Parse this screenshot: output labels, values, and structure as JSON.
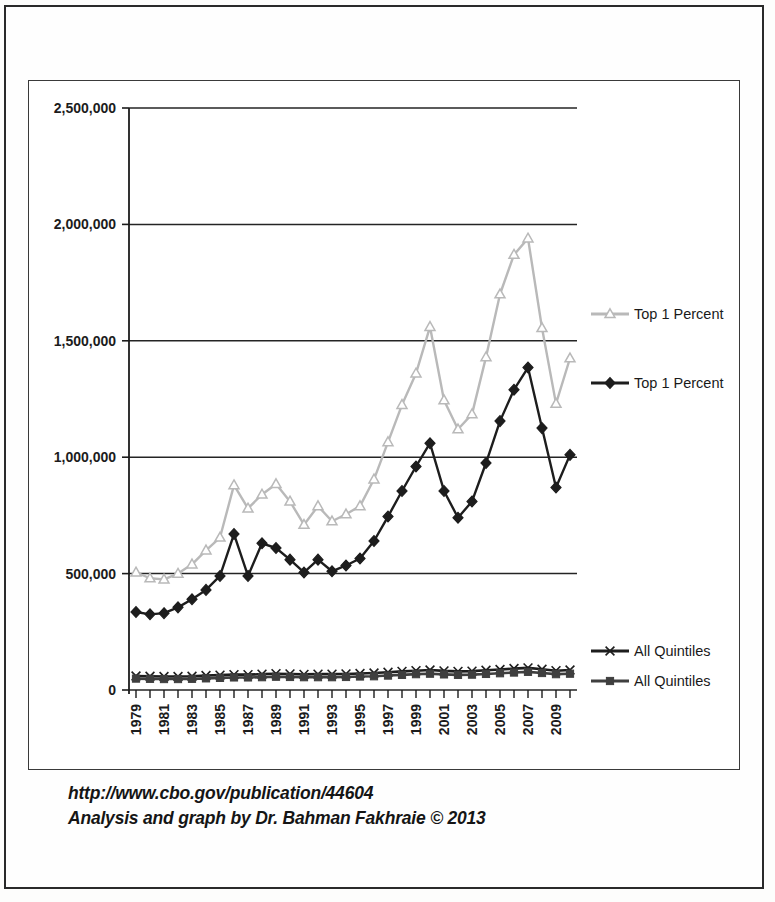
{
  "caption": {
    "line1": "http://www.cbo.gov/publication/44604",
    "line2": "Analysis and graph by Dr. Bahman Fakhraie © 2013"
  },
  "legend": [
    {
      "label": "Top 1 Percent",
      "marker": "triangle-marker",
      "color": "#b9b9b9"
    },
    {
      "label": "Top 1 Percent",
      "marker": "diamond-marker",
      "color": "#1d1d1d"
    },
    {
      "label": "All Quintiles",
      "marker": "x-marker",
      "color": "#1d1d1d"
    },
    {
      "label": "All Quintiles",
      "marker": "square-marker",
      "color": "#3f3f3f"
    }
  ],
  "chart_data": {
    "type": "line",
    "title": "",
    "xlabel": "",
    "ylabel": "",
    "grid": true,
    "legend_position": "right",
    "ylim": [
      0,
      2500000
    ],
    "yticks": [
      0,
      500000,
      1000000,
      1500000,
      2000000,
      2500000
    ],
    "ytick_labels": [
      "0",
      "500,000",
      "1,000,000",
      "1,500,000",
      "2,000,000",
      "2,500,000"
    ],
    "x": [
      1979,
      1980,
      1981,
      1982,
      1983,
      1984,
      1985,
      1986,
      1987,
      1988,
      1989,
      1990,
      1991,
      1992,
      1993,
      1994,
      1995,
      1996,
      1997,
      1998,
      1999,
      2000,
      2001,
      2002,
      2003,
      2004,
      2005,
      2006,
      2007,
      2008,
      2009,
      2010
    ],
    "xtick_labels": [
      "1979",
      "",
      "1981",
      "",
      "1983",
      "",
      "1985",
      "",
      "1987",
      "",
      "1989",
      "",
      "1991",
      "",
      "1993",
      "",
      "1995",
      "",
      "1997",
      "",
      "1999",
      "",
      "2001",
      "",
      "2003",
      "",
      "2005",
      "",
      "2007",
      "",
      "2009",
      ""
    ],
    "series": [
      {
        "name": "Top 1 Percent",
        "marker": "triangle-marker",
        "color": "#b9b9b9",
        "values": [
          505000,
          480000,
          475000,
          500000,
          540000,
          600000,
          655000,
          880000,
          780000,
          840000,
          885000,
          810000,
          710000,
          790000,
          725000,
          755000,
          790000,
          905000,
          1065000,
          1225000,
          1360000,
          1560000,
          1245000,
          1120000,
          1185000,
          1430000,
          1700000,
          1870000,
          1940000,
          1555000,
          1230000,
          1425000
        ]
      },
      {
        "name": "Top 1 Percent",
        "marker": "diamond-marker",
        "color": "#1d1d1d",
        "values": [
          335000,
          325000,
          330000,
          355000,
          390000,
          430000,
          490000,
          670000,
          490000,
          630000,
          610000,
          560000,
          505000,
          560000,
          510000,
          535000,
          565000,
          640000,
          745000,
          855000,
          960000,
          1060000,
          855000,
          740000,
          810000,
          975000,
          1155000,
          1290000,
          1385000,
          1125000,
          870000,
          1010000
        ]
      },
      {
        "name": "All Quintiles",
        "marker": "x-marker",
        "color": "#1d1d1d",
        "values": [
          60000,
          59000,
          58000,
          58000,
          59000,
          62000,
          64000,
          66000,
          66000,
          68000,
          70000,
          69000,
          67000,
          68000,
          68000,
          69000,
          71000,
          73000,
          76000,
          80000,
          83000,
          86000,
          82000,
          80000,
          81000,
          85000,
          88000,
          92000,
          95000,
          89000,
          83000,
          86000
        ]
      },
      {
        "name": "All Quintiles",
        "marker": "square-marker",
        "color": "#3f3f3f",
        "values": [
          49000,
          48000,
          47000,
          47000,
          48000,
          50000,
          52000,
          54000,
          54000,
          55000,
          57000,
          56000,
          55000,
          55000,
          55000,
          56000,
          58000,
          59000,
          62000,
          65000,
          68000,
          70000,
          67000,
          65000,
          66000,
          69000,
          72000,
          75000,
          78000,
          73000,
          68000,
          70000
        ]
      }
    ]
  }
}
